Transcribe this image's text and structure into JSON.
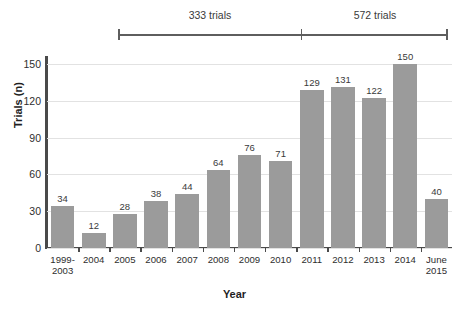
{
  "chart_data": {
    "type": "bar",
    "title": "",
    "xlabel": "Year",
    "ylabel": "Trials (n)",
    "categories": [
      "1999-\n2003",
      "2004",
      "2005",
      "2006",
      "2007",
      "2008",
      "2009",
      "2010",
      "2011",
      "2012",
      "2013",
      "2014",
      "June\n2015"
    ],
    "values": [
      34,
      12,
      28,
      38,
      44,
      64,
      76,
      71,
      129,
      131,
      122,
      150,
      40
    ],
    "ylim": [
      0,
      155
    ],
    "yticks": [
      0,
      30,
      60,
      90,
      120,
      150
    ],
    "ytick_labels": [
      "0",
      "30",
      "60",
      "90",
      "120",
      "150"
    ],
    "grid": true,
    "legend": "none",
    "bar_color": "#9b9b9b",
    "axis_color": "#4a4a4a",
    "gridline_color": "#e2e2e2",
    "annotations": [
      {
        "label": "333 trials",
        "span_start_category": "1999-\n2003",
        "span_end_category": "2010",
        "total": 333
      },
      {
        "label": "572 trials",
        "span_start_category": "2011",
        "span_end_category": "June\n2015",
        "total": 572
      }
    ]
  },
  "brackets": {
    "left_label": "333 trials",
    "right_label": "572 trials"
  },
  "axes": {
    "y_title": "Trials (n)",
    "x_title": "Year",
    "y_labels": [
      "150",
      "120",
      "90",
      "60",
      "30",
      "0"
    ]
  }
}
